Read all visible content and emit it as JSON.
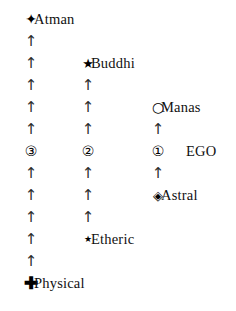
{
  "diagram": {
    "columns": [
      {
        "id": "col-3",
        "x": 20
      },
      {
        "id": "col-2",
        "x": 77
      },
      {
        "id": "col-1",
        "x": 147
      }
    ],
    "row_height": 22,
    "row_top": 8,
    "nodes": [
      {
        "id": "atman",
        "label": "Atman",
        "glyph": "✦",
        "icon": "six-pointed-star-icon",
        "glyph_class": "glyph-atman",
        "col": 0,
        "row": 0,
        "label_x": 34
      },
      {
        "id": "buddhi",
        "label": "Buddhi",
        "glyph": "★",
        "icon": "five-pointed-star-icon",
        "glyph_class": "glyph-star",
        "col": 1,
        "row": 2,
        "label_x": 91
      },
      {
        "id": "manas",
        "label": "Manas",
        "glyph": "○",
        "icon": "open-circle-icon",
        "glyph_class": "glyph-circle",
        "col": 2,
        "row": 4,
        "label_x": 161
      },
      {
        "id": "ego-3",
        "label": "",
        "glyph": "③",
        "icon": "circled-three-icon",
        "glyph_class": "glyph-num",
        "col": 0,
        "row": 6,
        "label_x": 34
      },
      {
        "id": "ego-2",
        "label": "",
        "glyph": "②",
        "icon": "circled-two-icon",
        "glyph_class": "glyph-num",
        "col": 1,
        "row": 6,
        "label_x": 91
      },
      {
        "id": "ego-1",
        "label": "EGO",
        "glyph": "①",
        "icon": "circled-one-icon",
        "glyph_class": "glyph-num",
        "col": 2,
        "row": 6,
        "label_x": 186
      },
      {
        "id": "astral",
        "label": "Astral",
        "glyph": "◈",
        "icon": "nested-diamond-icon",
        "glyph_class": "glyph-diamond",
        "col": 2,
        "row": 8,
        "label_x": 161
      },
      {
        "id": "etheric",
        "label": "Etheric",
        "glyph": "★",
        "icon": "small-star-icon",
        "glyph_class": "glyph-star-sm",
        "col": 1,
        "row": 10,
        "label_x": 91
      },
      {
        "id": "physical",
        "label": "Physical",
        "glyph": "✚",
        "icon": "bold-plus-icon",
        "glyph_class": "glyph-plus",
        "col": 0,
        "row": 12,
        "label_x": 34
      }
    ],
    "arrow_glyph": "↑",
    "arrow_icon": "up-arrow-icon",
    "arrows": [
      {
        "col": 0,
        "row": 1
      },
      {
        "col": 0,
        "row": 2
      },
      {
        "col": 0,
        "row": 3
      },
      {
        "col": 0,
        "row": 4
      },
      {
        "col": 0,
        "row": 5
      },
      {
        "col": 0,
        "row": 7
      },
      {
        "col": 0,
        "row": 8
      },
      {
        "col": 0,
        "row": 9
      },
      {
        "col": 0,
        "row": 10
      },
      {
        "col": 0,
        "row": 11
      },
      {
        "col": 1,
        "row": 3
      },
      {
        "col": 1,
        "row": 4
      },
      {
        "col": 1,
        "row": 5
      },
      {
        "col": 1,
        "row": 7
      },
      {
        "col": 1,
        "row": 8
      },
      {
        "col": 1,
        "row": 9
      },
      {
        "col": 2,
        "row": 5
      },
      {
        "col": 2,
        "row": 7
      }
    ],
    "colors": {
      "background": "#ffffff",
      "text": "#111111",
      "arrow": "#2b2b2b",
      "marker": "#000000"
    }
  }
}
